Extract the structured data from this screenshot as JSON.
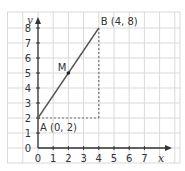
{
  "diagram": {
    "type": "coordinate-plane",
    "axes": {
      "x_label": "x",
      "y_label": "y",
      "x_ticks": [
        "0",
        "1",
        "2",
        "3",
        "4",
        "5",
        "6",
        "7"
      ],
      "y_ticks": [
        "0",
        "1",
        "2",
        "3",
        "4",
        "5",
        "6",
        "7",
        "8"
      ]
    },
    "points": [
      {
        "id": "A",
        "label": "A (0, 2)",
        "x": 0,
        "y": 2
      },
      {
        "id": "B",
        "label": "B (4, 8)",
        "x": 4,
        "y": 8
      },
      {
        "id": "M",
        "label": "M",
        "x": 2,
        "y": 5
      }
    ],
    "segment": {
      "from": "A",
      "to": "B"
    },
    "dashed_guides": [
      {
        "from": [
          0,
          2
        ],
        "to": [
          4,
          2
        ]
      },
      {
        "from": [
          4,
          2
        ],
        "to": [
          4,
          8
        ]
      }
    ],
    "colors": {
      "grid": "#d9d9d9",
      "axis": "#333333",
      "segment": "#555555",
      "guide": "#777777"
    }
  }
}
